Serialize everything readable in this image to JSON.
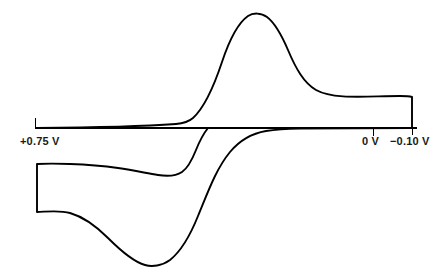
{
  "figure": {
    "type": "cyclic-voltammogram",
    "background_color": "#ffffff",
    "trace_color": "#000000",
    "axis_color": "#000000"
  },
  "axis": {
    "labels": {
      "start_potential": "+0.75 V",
      "zero_potential": "0 V",
      "switch_potential": "−0.10 V"
    },
    "baseline_y": 128,
    "x_start": 35,
    "x_end": 417,
    "ticks": [
      {
        "name": "start-tick",
        "x": 35,
        "direction": "up",
        "length": 10
      },
      {
        "name": "zero-tick",
        "x": 373,
        "direction": "down",
        "length": 9
      },
      {
        "name": "switch-tick",
        "x": 412,
        "direction": "down",
        "length": 8
      }
    ]
  },
  "chart_data": {
    "type": "line",
    "title": "",
    "xlabel": "",
    "ylabel": "",
    "x_axis_direction": "positive-to-negative",
    "x_tick_labels": [
      "+0.75 V",
      "0 V",
      "−0.10 V"
    ],
    "x_tick_values": [
      0.75,
      0.0,
      -0.1
    ],
    "grid": false,
    "legend": false,
    "series": [
      {
        "name": "anodic-forward-sweep",
        "description": "Upper branch: scan from +0.75 V toward -0.10 V producing the oxidation peak",
        "peak_label": "anodic peak",
        "peak_x_px": 256,
        "peak_y_px": 14,
        "zero_crossing_x_px": 188,
        "path": "M 37 128 C 90 127.6 140 126.6 176 124 C 183 123.4 188 122.4 193 118 C 205 107 214 86 222 62 C 229 41 238 23 248 16 C 253 12.6 261 12.6 267 17 C 275 23 282 36 288 50 C 296 69 304 83 316 90 C 334 100 368 96 400 96 C 406 96 410 96.4 412 97 L 412 128"
      },
      {
        "name": "cathodic-return-sweep",
        "description": "Lower branch: reverse scan back toward +0.75 V producing the reduction peak",
        "peak_label": "cathodic peak",
        "peak_x_px": 148,
        "peak_y_px": 265,
        "path": "M 412 128 L 300 128.6 C 288 128.8 276 129.4 266 131 C 252 133.4 240 140 230 152 C 216 169 208 192 198 216 C 190 236 180 252 170 260 C 162 266 152 267 145 265 C 134 262 120 250 108 238 C 96 226 84 217 70 213 C 60 210 48 211.6 37 212 L 37 164 C 45 163.6 58 163.6 70 164 C 88 164.6 104 166 118 168 C 134 170.4 146 173 158 175 C 168 176.6 176 176 182 172 C 188 168 192 160 196 150 C 200 140 204 133 208 128"
      }
    ],
    "annotations": [
      {
        "name": "left-switching-edge",
        "x_px": 37,
        "y_from_px": 164,
        "y_to_px": 212
      },
      {
        "name": "right-switching-edge",
        "x_px": 412,
        "y_from_px": 97,
        "y_to_px": 128
      }
    ]
  }
}
